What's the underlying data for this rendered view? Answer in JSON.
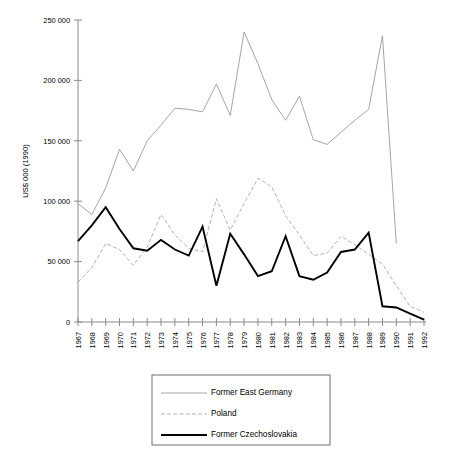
{
  "chart_data": {
    "type": "line",
    "title": "",
    "xlabel": "",
    "ylabel": "US$ 000 (1990)",
    "ylim": [
      0,
      250000
    ],
    "yticks": [
      0,
      50000,
      100000,
      150000,
      200000,
      250000
    ],
    "ytick_labels": [
      "0",
      "50 000",
      "100 000",
      "150 000",
      "200 000",
      "250 000"
    ],
    "grid": false,
    "legend_position": "bottom-center",
    "categories": [
      "1967",
      "1968",
      "1969",
      "1970",
      "1971",
      "1972",
      "1973",
      "1974",
      "1975",
      "1976",
      "1977",
      "1978",
      "1979",
      "1980",
      "1981",
      "1982",
      "1983",
      "1984",
      "1985",
      "1986",
      "1987",
      "1988",
      "1989",
      "1990",
      "1991",
      "1992"
    ],
    "series": [
      {
        "name": "Former East Germany",
        "style": "solid-thin-gray",
        "color": "#9b9b9b",
        "values": [
          98000,
          89000,
          111000,
          143000,
          125000,
          150000,
          163000,
          177000,
          176000,
          174000,
          197000,
          171000,
          240000,
          214000,
          184000,
          167000,
          187000,
          151000,
          147000,
          157000,
          167000,
          176000,
          237000,
          65000,
          null,
          null
        ]
      },
      {
        "name": "Poland",
        "style": "dashed-gray",
        "color": "#a8a8a8",
        "values": [
          33000,
          45000,
          65000,
          60000,
          47000,
          62000,
          89000,
          72000,
          61000,
          58000,
          102000,
          76000,
          98000,
          119000,
          112000,
          88000,
          72000,
          55000,
          57000,
          71000,
          64000,
          56000,
          48000,
          30000,
          13000,
          8000
        ]
      },
      {
        "name": "Former Czechoslovakia",
        "style": "solid-thick-black",
        "color": "#000000",
        "values": [
          67000,
          80000,
          95000,
          77000,
          61000,
          59000,
          68000,
          60000,
          55000,
          79000,
          30000,
          73000,
          56000,
          38000,
          42000,
          71000,
          38000,
          35000,
          41000,
          58000,
          60000,
          74000,
          13000,
          12000,
          7000,
          2000
        ]
      }
    ]
  },
  "legend": {
    "entries": [
      {
        "label": "Former East Germany",
        "key": "eg"
      },
      {
        "label": "Poland",
        "key": "pl"
      },
      {
        "label": "Former Czechoslovakia",
        "key": "cz"
      }
    ]
  }
}
